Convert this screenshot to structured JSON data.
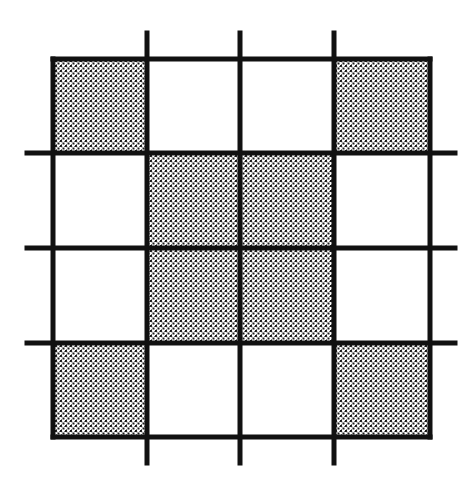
{
  "diagram": {
    "type": "grid",
    "rows": 4,
    "cols": 4,
    "shaded_cells": [
      [
        0,
        0
      ],
      [
        0,
        3
      ],
      [
        1,
        1
      ],
      [
        1,
        2
      ],
      [
        2,
        1
      ],
      [
        2,
        2
      ],
      [
        3,
        0
      ],
      [
        3,
        3
      ]
    ],
    "shade_pattern": "cross-hatch-dots",
    "colors": {
      "line": "#111111",
      "background": "#ffffff",
      "shade_ink": "#1a1a1a"
    },
    "interior_lines_extend_beyond_border": true
  }
}
